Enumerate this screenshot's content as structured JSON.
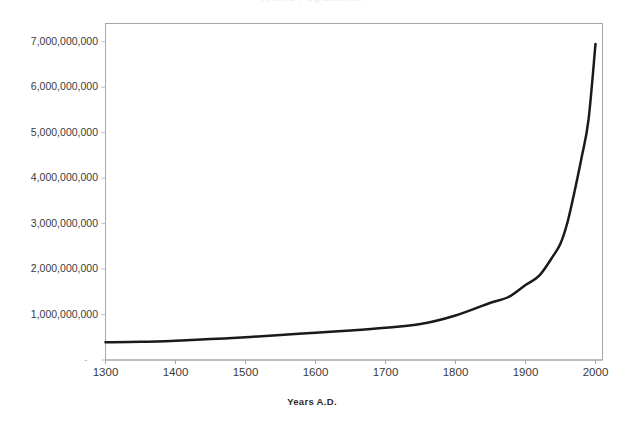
{
  "chart_data": {
    "type": "line",
    "title": "World Population",
    "title_note": "cropped at top edge of image, only faint letter bottoms visible",
    "xlabel": "Years A.D.",
    "ylabel": "",
    "xlim": [
      1300,
      2010
    ],
    "ylim": [
      0,
      7400000000
    ],
    "grid": false,
    "legend": "none",
    "xticks": [
      1300,
      1400,
      1500,
      1600,
      1700,
      1800,
      1900,
      2000
    ],
    "xtick_labels": [
      "1300",
      "1400",
      "1500",
      "1600",
      "1700",
      "1800",
      "1900",
      "2000"
    ],
    "yticks": [
      0,
      1000000000,
      2000000000,
      3000000000,
      4000000000,
      5000000000,
      6000000000,
      7000000000
    ],
    "ytick_labels": [
      "-",
      "1,000,000,000",
      "2,000,000,000",
      "3,000,000,000",
      "4,000,000,000",
      "5,000,000,000",
      "6,000,000,000",
      "7,000,000,000"
    ],
    "line_color": "#1a1a1a",
    "line_width": 2.5,
    "plot_border_color": "#a8a8a8",
    "plot_background": "#ffffff",
    "series": [
      {
        "name": "World Population",
        "x": [
          1300,
          1350,
          1400,
          1450,
          1500,
          1550,
          1600,
          1650,
          1700,
          1750,
          1800,
          1850,
          1875,
          1900,
          1920,
          1940,
          1950,
          1960,
          1970,
          1980,
          1990,
          2000
        ],
        "values": [
          390000000,
          400000000,
          425000000,
          460000000,
          500000000,
          550000000,
          600000000,
          650000000,
          710000000,
          790000000,
          980000000,
          1260000000,
          1380000000,
          1650000000,
          1860000000,
          2300000000,
          2560000000,
          3030000000,
          3700000000,
          4440000000,
          5280000000,
          6950000000
        ]
      }
    ]
  },
  "axes": {
    "x_title": "Years A.D."
  }
}
